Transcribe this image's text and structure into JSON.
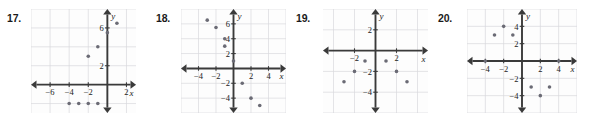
{
  "page": {
    "background_color": "#ffffff",
    "plot_background_color": "#fdfdfd",
    "grid_color": "#d8d8dc",
    "axis_color": "#3a3a3a",
    "point_color": "#6b6b75"
  },
  "problems": [
    {
      "number": "17.",
      "chart_data": {
        "type": "scatter",
        "title": "",
        "xlabel": "x",
        "ylabel": "y",
        "xlim": [
          -8,
          3
        ],
        "ylim": [
          -3,
          8
        ],
        "xticks": [
          -6,
          -4,
          -2,
          2
        ],
        "xtick_labels": [
          "−6",
          "−4",
          "−2",
          "2"
        ],
        "yticks": [
          2,
          6
        ],
        "ytick_labels": [
          "2",
          "6"
        ],
        "grid": true,
        "grid_step": 2,
        "points": [
          {
            "x": -4,
            "y": -2
          },
          {
            "x": -3,
            "y": -2
          },
          {
            "x": -2,
            "y": -2
          },
          {
            "x": -1,
            "y": -2
          },
          {
            "x": -2,
            "y": 3
          },
          {
            "x": -1,
            "y": 4
          },
          {
            "x": 0,
            "y": 5.5
          },
          {
            "x": 1,
            "y": 6.5
          }
        ]
      }
    },
    {
      "number": "18.",
      "chart_data": {
        "type": "scatter",
        "title": "",
        "xlabel": "x",
        "ylabel": "y",
        "xlim": [
          -6,
          6
        ],
        "ylim": [
          -6,
          8
        ],
        "xticks": [
          -4,
          -2,
          2,
          4
        ],
        "xtick_labels": [
          "−4",
          "−2",
          "2",
          "4"
        ],
        "yticks": [
          -4,
          -2,
          2,
          4,
          6
        ],
        "ytick_labels": [
          "−4",
          "−2",
          "2",
          "4",
          "6"
        ],
        "grid": true,
        "grid_step": 2,
        "points": [
          {
            "x": -3,
            "y": 6.5
          },
          {
            "x": -2,
            "y": 5.5
          },
          {
            "x": -1,
            "y": 4
          },
          {
            "x": -1,
            "y": 3
          },
          {
            "x": 0,
            "y": 1
          },
          {
            "x": 1,
            "y": -2
          },
          {
            "x": 2,
            "y": -4
          },
          {
            "x": 3,
            "y": -5
          }
        ]
      }
    },
    {
      "number": "19.",
      "chart_data": {
        "type": "scatter",
        "title": "",
        "xlabel": "x",
        "ylabel": "y",
        "xlim": [
          -5,
          5
        ],
        "ylim": [
          -6,
          4
        ],
        "xticks": [
          -2,
          2
        ],
        "xtick_labels": [
          "−2",
          "2"
        ],
        "yticks": [
          -4,
          -2,
          2
        ],
        "ytick_labels": [
          "−4",
          "−2",
          "2"
        ],
        "grid": true,
        "grid_step": 2,
        "points": [
          {
            "x": -3,
            "y": -3
          },
          {
            "x": -2,
            "y": -2
          },
          {
            "x": -1,
            "y": -1
          },
          {
            "x": 1,
            "y": -1
          },
          {
            "x": 2,
            "y": -2
          },
          {
            "x": 3,
            "y": -3
          }
        ]
      }
    },
    {
      "number": "20.",
      "chart_data": {
        "type": "scatter",
        "title": "",
        "xlabel": "x",
        "ylabel": "y",
        "xlim": [
          -6,
          6
        ],
        "ylim": [
          -6,
          6
        ],
        "xticks": [
          -4,
          -2,
          2,
          4
        ],
        "xtick_labels": [
          "−4",
          "−2",
          "2",
          "4"
        ],
        "yticks": [
          -4,
          -2,
          2,
          4
        ],
        "ytick_labels": [
          "−4",
          "−2",
          "2",
          "4"
        ],
        "grid": true,
        "grid_step": 2,
        "points": [
          {
            "x": -4,
            "y": 0
          },
          {
            "x": -3,
            "y": 3
          },
          {
            "x": -2,
            "y": 4
          },
          {
            "x": -1,
            "y": 3
          },
          {
            "x": 1,
            "y": -3
          },
          {
            "x": 2,
            "y": -4
          },
          {
            "x": 3,
            "y": -3
          },
          {
            "x": 4,
            "y": 0
          }
        ]
      }
    }
  ]
}
